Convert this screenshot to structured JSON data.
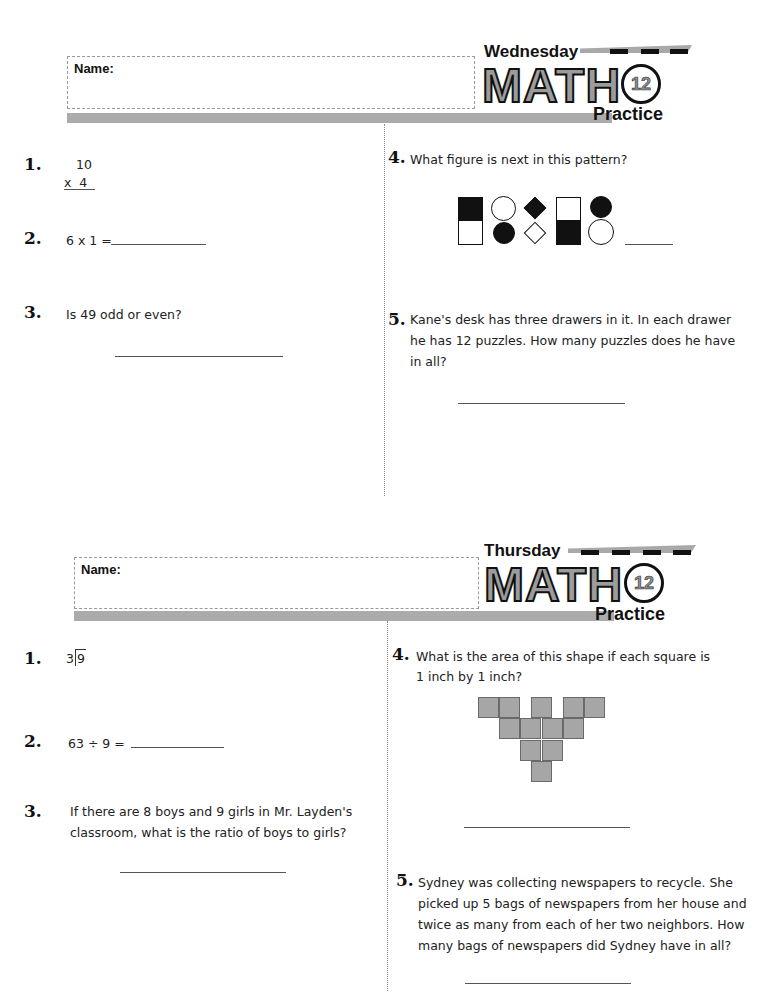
{
  "worksheets": [
    {
      "day": "Wednesday",
      "logo": {
        "title": "MATH",
        "number": "12",
        "subtitle": "Practice"
      },
      "name_label": "Name:",
      "questions": [
        {
          "number": "1.",
          "top": "10",
          "bottom": "x  4"
        },
        {
          "number": "2.",
          "text": "6 x 1 ="
        },
        {
          "number": "3.",
          "text": "Is 49 odd or even?"
        },
        {
          "number": "4.",
          "text": "What figure is next in this pattern?",
          "pattern": [
            {
              "shape": "square",
              "top": "black",
              "bottom": "white"
            },
            {
              "shape": "circle",
              "top": "white",
              "bottom": "black"
            },
            {
              "shape": "diamond",
              "top": "black",
              "bottom": "white"
            },
            {
              "shape": "square",
              "top": "white",
              "bottom": "black"
            },
            {
              "shape": "circle",
              "top": "black",
              "bottom": "white"
            }
          ]
        },
        {
          "number": "5.",
          "lines": [
            "Kane's desk has three drawers in it. In each drawer",
            "he has 12 puzzles. How many puzzles does he have",
            "in all?"
          ]
        }
      ]
    },
    {
      "day": "Thursday",
      "logo": {
        "title": "MATH",
        "number": "12",
        "subtitle": "Practice"
      },
      "name_label": "Name:",
      "questions": [
        {
          "number": "1.",
          "divisor": "3",
          "dividend": "9"
        },
        {
          "number": "2.",
          "text": "63 ÷ 9 ="
        },
        {
          "number": "3.",
          "lines": [
            "If there are 8 boys and 9 girls in Mr. Layden's",
            "classroom, what is the ratio of boys to girls?"
          ]
        },
        {
          "number": "4.",
          "lines": [
            "What is the area of this shape if each square is",
            "1 inch by 1 inch?"
          ],
          "shape_square_count": 12
        },
        {
          "number": "5.",
          "lines": [
            "Sydney was collecting newspapers to recycle. She",
            "picked up 5 bags of newspapers from her house and",
            "twice as many from each of her two neighbors. How",
            "many bags of newspapers did Sydney have in all?"
          ]
        }
      ]
    }
  ],
  "colors": {
    "bar_gray": "#ababab",
    "shape_gray": "#a6a6a6",
    "ink": "#111111"
  }
}
